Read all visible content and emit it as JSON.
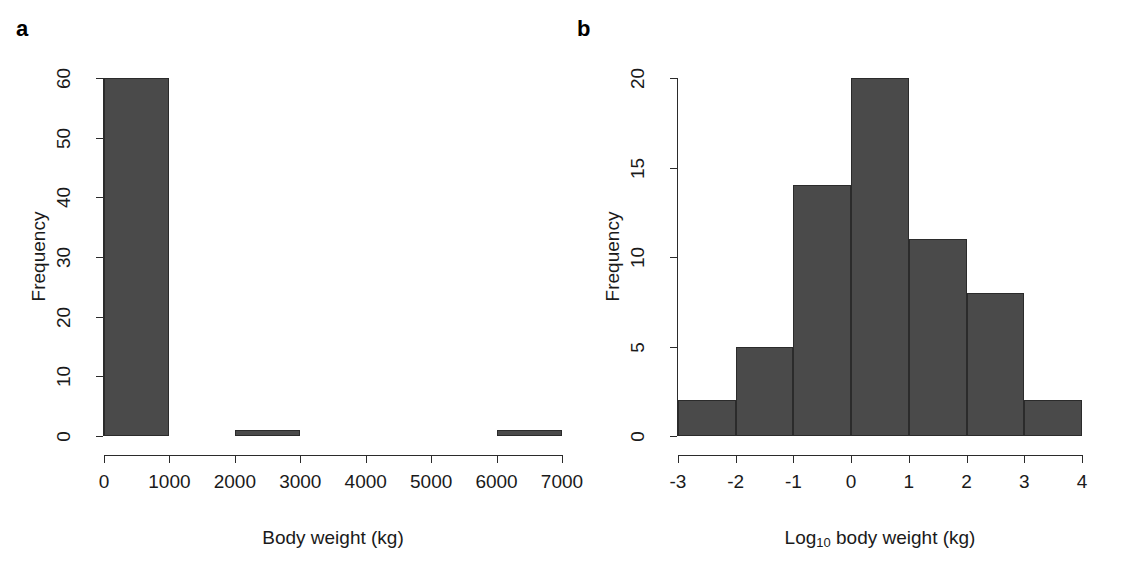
{
  "figure": {
    "background": "#ffffff",
    "bar_fill": "#4a4a4a",
    "bar_stroke": "#2b2b2b",
    "axis_color": "#2b2b2b"
  },
  "panels": [
    {
      "letter": "a",
      "ylabel": "Frequency",
      "xlabel": "Body weight (kg)",
      "xlabel_sub": "",
      "ytick_labels": [
        "0",
        "10",
        "20",
        "30",
        "40",
        "50",
        "60"
      ],
      "xtick_labels": [
        "0",
        "1000",
        "2000",
        "3000",
        "4000",
        "5000",
        "6000",
        "7000"
      ]
    },
    {
      "letter": "b",
      "ylabel": "Frequency",
      "xlabel_pre": "Log",
      "xlabel_sub": "10",
      "xlabel_post": " body weight (kg)",
      "ytick_labels": [
        "0",
        "5",
        "10",
        "15",
        "20"
      ],
      "xtick_labels": [
        "-3",
        "-2",
        "-1",
        "0",
        "1",
        "2",
        "3",
        "4"
      ]
    }
  ],
  "chart_data": [
    {
      "type": "bar",
      "panel": "a",
      "title": "",
      "xlabel": "Body weight (kg)",
      "ylabel": "Frequency",
      "bin_edges": [
        0,
        1000,
        2000,
        3000,
        4000,
        5000,
        6000,
        7000
      ],
      "categories": [
        "0-1000",
        "1000-2000",
        "2000-3000",
        "3000-4000",
        "4000-5000",
        "5000-6000",
        "6000-7000"
      ],
      "values": [
        60,
        0,
        1,
        0,
        0,
        0,
        1
      ],
      "xlim": [
        0,
        7000
      ],
      "ylim": [
        0,
        60
      ],
      "xticks": [
        0,
        1000,
        2000,
        3000,
        4000,
        5000,
        6000,
        7000
      ],
      "yticks": [
        0,
        10,
        20,
        30,
        40,
        50,
        60
      ],
      "grid": false,
      "legend": "none"
    },
    {
      "type": "bar",
      "panel": "b",
      "title": "",
      "xlabel": "Log10 body weight (kg)",
      "ylabel": "Frequency",
      "bin_edges": [
        -3,
        -2,
        -1,
        0,
        1,
        2,
        3,
        4
      ],
      "categories": [
        "-3 to -2",
        "-2 to -1",
        "-1 to 0",
        "0 to 1",
        "1 to 2",
        "2 to 3",
        "3 to 4"
      ],
      "values": [
        2,
        5,
        14,
        20,
        11,
        8,
        2
      ],
      "xlim": [
        -3,
        4
      ],
      "ylim": [
        0,
        20
      ],
      "xticks": [
        -3,
        -2,
        -1,
        0,
        1,
        2,
        3,
        4
      ],
      "yticks": [
        0,
        5,
        10,
        15,
        20
      ],
      "grid": false,
      "legend": "none"
    }
  ]
}
